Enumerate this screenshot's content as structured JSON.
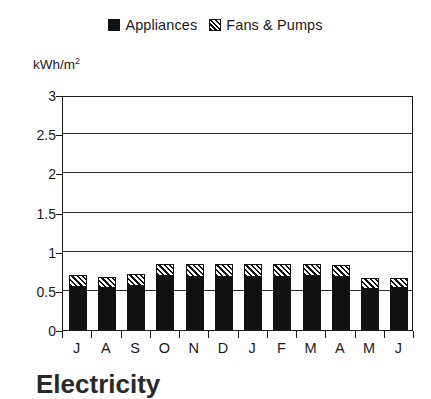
{
  "chart_data": {
    "type": "bar",
    "subtype": "stacked",
    "title": "Electricity",
    "xlabel": "",
    "ylabel": "kWh/m2",
    "ylabel_display": "kWh/m",
    "ylabel_superscript": "2",
    "categories": [
      "J",
      "A",
      "S",
      "O",
      "N",
      "D",
      "J",
      "F",
      "M",
      "A",
      "M",
      "J"
    ],
    "ylim": [
      0,
      3
    ],
    "yticks": [
      0,
      0.5,
      1,
      1.5,
      2,
      2.5,
      3
    ],
    "ytick_labels": [
      "0",
      "0.5",
      "1",
      "1.5",
      "2",
      "2.5",
      "3"
    ],
    "grid": true,
    "grid_axis": "y",
    "legend_position": "top-center",
    "series": [
      {
        "name": "Appliances",
        "pattern": "solid",
        "color": "#111111",
        "values": [
          0.55,
          0.54,
          0.56,
          0.69,
          0.68,
          0.68,
          0.68,
          0.68,
          0.69,
          0.68,
          0.52,
          0.53
        ]
      },
      {
        "name": "Fans & Pumps",
        "pattern": "hatch",
        "color": "#ffffff",
        "values": [
          0.15,
          0.14,
          0.15,
          0.15,
          0.16,
          0.16,
          0.16,
          0.16,
          0.15,
          0.15,
          0.14,
          0.14
        ]
      }
    ],
    "totals": [
      0.7,
      0.68,
      0.71,
      0.84,
      0.84,
      0.84,
      0.84,
      0.84,
      0.84,
      0.83,
      0.66,
      0.67
    ]
  },
  "legend": {
    "entries": [
      {
        "label": "Appliances",
        "swatch": "solid-square-icon"
      },
      {
        "label": "Fans & Pumps",
        "swatch": "hatched-square-icon"
      }
    ]
  },
  "axis": {
    "unit_label_main": "kWh/m",
    "unit_label_sup": "2"
  }
}
